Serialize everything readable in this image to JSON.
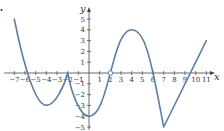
{
  "chart_data": {
    "type": "line",
    "title": "",
    "xlabel": "x",
    "ylabel": "y",
    "xlim": [
      -7.8,
      11.9
    ],
    "ylim": [
      -5.4,
      5.8
    ],
    "grid": false,
    "legend": null,
    "x_ticks": [
      -7,
      -6,
      -5,
      -4,
      -3,
      -2,
      -1,
      1,
      2,
      3,
      4,
      5,
      6,
      7,
      8,
      9,
      10,
      11
    ],
    "y_ticks": [
      -5,
      -4,
      -3,
      -2,
      -1,
      1,
      2,
      3,
      4,
      5
    ],
    "series": [
      {
        "name": "f(x)",
        "color": "#5b7fa6",
        "key_points": [
          {
            "x": -7,
            "y": 5
          },
          {
            "x": -6,
            "y": 0
          },
          {
            "x": -4,
            "y": -3,
            "note": "local minimum"
          },
          {
            "x": -2,
            "y": 0,
            "note": "cusp"
          },
          {
            "x": 0,
            "y": -4,
            "note": "local minimum"
          },
          {
            "x": 2,
            "y": 0,
            "note": "open circle"
          },
          {
            "x": 4,
            "y": 4,
            "note": "local maximum"
          },
          {
            "x": 6,
            "y": 0
          },
          {
            "x": 7,
            "y": -5,
            "note": "corner minimum"
          },
          {
            "x": 9,
            "y": 0
          },
          {
            "x": 11,
            "y": 3
          }
        ]
      }
    ],
    "annotations": [
      {
        "type": "open-circle",
        "x": 2,
        "y": 0
      }
    ]
  },
  "axes": {
    "x_title": "x",
    "y_title": "y"
  }
}
